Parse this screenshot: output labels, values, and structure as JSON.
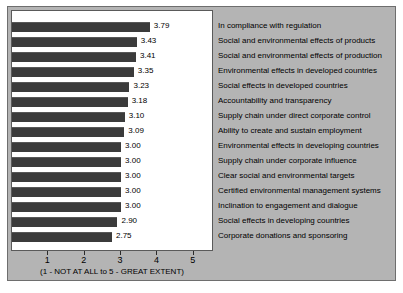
{
  "chart_data": {
    "type": "bar",
    "orientation": "horizontal",
    "title": "",
    "subtitle": "",
    "xlabel": "(1 - NOT AT ALL to 5 - GREAT EXTENT)",
    "ylabel": "",
    "xlim": [
      0,
      5.5
    ],
    "xticks": [
      1,
      2,
      3,
      4,
      5
    ],
    "xtick_labels": [
      "1",
      "2",
      "3",
      "4",
      "5"
    ],
    "grid": false,
    "legend_position": "right",
    "bar_color": "#3b3b3b",
    "plot_background": "#ffffff",
    "figure_background": "#b4b4b4",
    "categories": [
      "In compliance with regulation",
      "Social and environmental effects of products",
      "Social and environmental effects of production",
      "Environmental effects in developed countries",
      "Social effects in developed countries",
      "Accountability and transparency",
      "Supply chain under direct corporate control",
      "Ability to create and sustain employment",
      "Environmental effects in developing countries",
      "Supply chain under corporate influence",
      "Clear social and environmental targets",
      "Certified environmental management systems",
      "Inclination to engagement and dialogue",
      "Social effects in developing countries",
      "Corporate donations and sponsoring"
    ],
    "values": [
      3.79,
      3.43,
      3.41,
      3.35,
      3.23,
      3.18,
      3.1,
      3.09,
      3.0,
      3.0,
      3.0,
      3.0,
      3.0,
      2.9,
      2.75
    ],
    "value_labels": [
      "3.79",
      "3.43",
      "3.41",
      "3.35",
      "3.23",
      "3.18",
      "3.10",
      "3.09",
      "3.00",
      "3.00",
      "3.00",
      "3.00",
      "3.00",
      "2.90",
      "2.75"
    ]
  }
}
